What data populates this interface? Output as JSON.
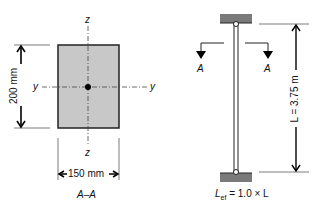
{
  "section": {
    "axis_z_top": "z",
    "axis_z_bottom": "z",
    "axis_y_left": "y",
    "axis_y_right": "y",
    "height_dim": "200 mm",
    "width_dim": "150 mm",
    "caption": "A–A",
    "fill_color": "#c8c8c8"
  },
  "column": {
    "section_mark_left": "A",
    "section_mark_right": "A",
    "length_dim": "L = 3.75 m",
    "effective_length": "= 1.0 × L",
    "effective_length_symbol": "L",
    "effective_length_sub": "ef",
    "support_color": "#7a7a7a"
  }
}
